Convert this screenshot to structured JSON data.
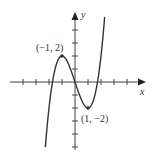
{
  "figure": {
    "function": "y = x^3 - 3x",
    "axes": {
      "x_label": "x",
      "y_label": "y",
      "origin_px": [
        75,
        82
      ],
      "unit_px": 13,
      "x_ticks": [
        -4,
        -3,
        -2,
        -1,
        1,
        2,
        3,
        4
      ],
      "y_ticks": [
        4,
        3,
        2,
        1,
        -1,
        -2,
        -3,
        -4,
        -5
      ]
    },
    "points": [
      {
        "label": "(−1, 2)",
        "x": -1,
        "y": 2
      },
      {
        "label": "(1, −2)",
        "x": 1,
        "y": -2
      }
    ],
    "colors": {
      "curve": "#333333",
      "axis": "#444444",
      "background": "#ffffff"
    }
  }
}
